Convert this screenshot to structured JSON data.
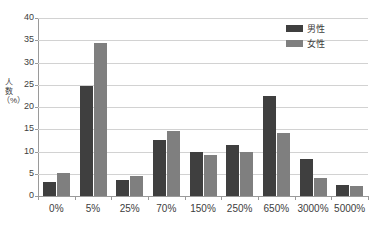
{
  "chart_data": {
    "type": "bar",
    "title": "",
    "xlabel": "",
    "ylabel": "人数（%）",
    "ylim": [
      0,
      40
    ],
    "ytick_step": 5,
    "yticks": [
      "0",
      "5",
      "10",
      "15",
      "20",
      "25",
      "30",
      "35",
      "40"
    ],
    "grid": true,
    "legend_position": "top-right",
    "categories": [
      "0%",
      "5%",
      "25%",
      "70%",
      "150%",
      "250%",
      "650%",
      "3000%",
      "5000%"
    ],
    "series": [
      {
        "name": "男性",
        "color": "#3f3f3f",
        "values": [
          3.2,
          24.7,
          3.5,
          12.6,
          9.8,
          11.4,
          22.5,
          8.3,
          2.4
        ]
      },
      {
        "name": "女性",
        "color": "#7f7f7f",
        "values": [
          5.2,
          34.3,
          4.5,
          14.5,
          9.2,
          9.8,
          14.2,
          4.1,
          2.3
        ]
      }
    ]
  },
  "colors": {
    "male": "#3f3f3f",
    "female": "#7f7f7f",
    "grid": "#d2d2d2",
    "axis": "#9a9a9a",
    "text": "#3d3d3d",
    "background": "#ffffff"
  }
}
